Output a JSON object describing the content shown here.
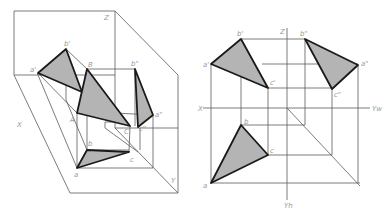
{
  "figure": {
    "colors": {
      "background": "#ffffff",
      "construction_line": "#5a5a5a",
      "outline": "#1a1a1a",
      "triangle_fill": "#b4b4b4",
      "label": "#9a9a9a"
    }
  },
  "left_view": {
    "name": "axonometric-view",
    "axis_labels": {
      "x": "X",
      "y": "Y",
      "z": "Z"
    },
    "point_labels": {
      "a_front": "a'",
      "b_front": "b'",
      "a_side": "a\"",
      "b_side": "b\"",
      "c_side": "c\"",
      "A": "A",
      "B": "B",
      "C": "C",
      "a": "a",
      "b": "b",
      "c": "c"
    }
  },
  "right_view": {
    "name": "orthographic-view",
    "axis_labels": {
      "x": "X",
      "z": "Z",
      "yw": "Yw",
      "yh": "Yh"
    },
    "point_labels": {
      "a_front": "a'",
      "b_front": "b'",
      "c_front": "c'",
      "a_side": "a\"",
      "b_side": "b\"",
      "c_side": "c\"",
      "a": "a",
      "b": "b",
      "c": "c"
    }
  }
}
